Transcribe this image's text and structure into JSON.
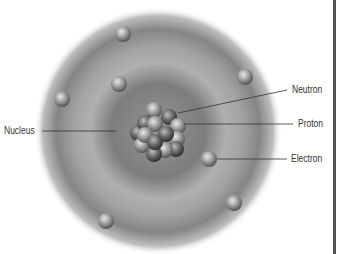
{
  "diagram": {
    "labels": {
      "nucleus": "Nucleus",
      "neutron": "Neutron",
      "proton": "Proton",
      "electron": "Electron"
    },
    "electron_count": 9,
    "colors": {
      "cloud_dark": "#7a7a7a",
      "cloud_light": "#b5b5b5",
      "particle": "#9a9a9a",
      "leader_line": "#333333",
      "border": "#555555"
    }
  }
}
